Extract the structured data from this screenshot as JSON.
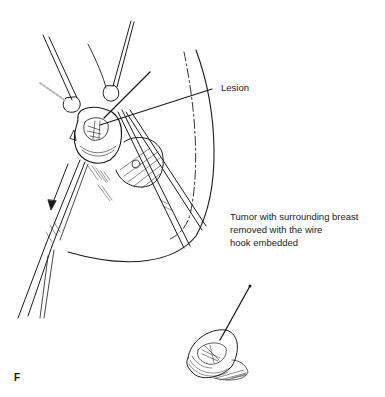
{
  "figure": {
    "panel_letter": "F",
    "labels": {
      "lesion": "Lesion",
      "tumor_caption_lines": [
        "Tumor with surrounding breast",
        "removed with the wire",
        "hook embedded"
      ]
    },
    "elements": [
      {
        "name": "breast-outline",
        "description": "curved outline of breast with dashed incision line"
      },
      {
        "name": "retractor-clamps",
        "description": "two clamp instruments holding tissue"
      },
      {
        "name": "forceps-left",
        "description": "long forceps pulling tissue with direction arrow"
      },
      {
        "name": "forceps-right",
        "description": "second forceps / scissors"
      },
      {
        "name": "lesion-mass",
        "description": "excised tissue with lesion grasped"
      },
      {
        "name": "nipple-areola",
        "description": "shaded areola region"
      },
      {
        "name": "excised-specimen",
        "description": "removed tumor specimen with wire hook"
      }
    ],
    "colors": {
      "ink": "#1a1a1a",
      "background": "#ffffff"
    }
  }
}
